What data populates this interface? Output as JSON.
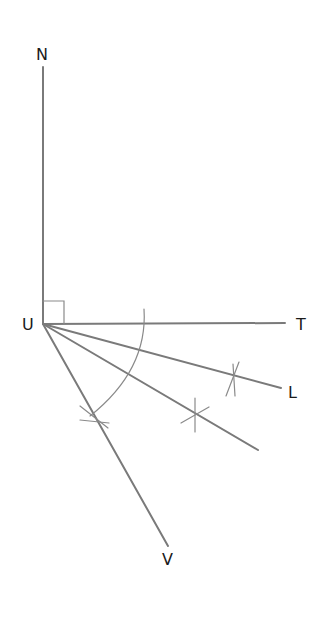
{
  "diagram": {
    "type": "geometric-construction",
    "points": {
      "N": {
        "label": "N"
      },
      "U": {
        "label": "U"
      },
      "T": {
        "label": "T"
      },
      "L": {
        "label": "L"
      },
      "V": {
        "label": "V"
      }
    },
    "rays": [
      {
        "from": "U",
        "to": "N"
      },
      {
        "from": "U",
        "to": "T"
      },
      {
        "from": "U",
        "to": "L"
      },
      {
        "from": "U",
        "to": "unlabeled"
      },
      {
        "from": "U",
        "to": "V"
      }
    ],
    "annotations": {
      "right_angle": "angle NUT",
      "arc": "compass arc centered at U",
      "arc_marks": 3
    },
    "colors": {
      "line": "#7a7a7a",
      "label": "#1a1a1a",
      "background": "#ffffff"
    }
  }
}
